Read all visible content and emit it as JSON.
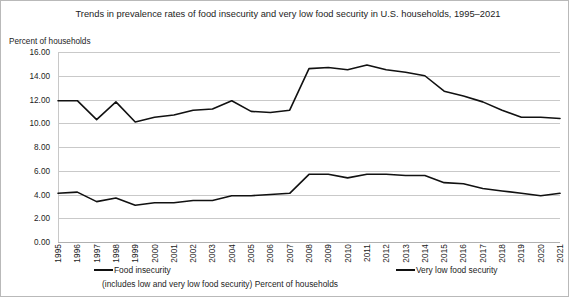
{
  "chart_data": {
    "type": "line",
    "title": "Trends in prevalence rates of food insecurity and very low food security in U.S. households, 1995–2021",
    "ylabel": "Percent of households",
    "xlabel": "",
    "ylim": [
      0.0,
      16.0
    ],
    "ytick_step": 2.0,
    "ytick_labels": [
      "0.00",
      "2.00",
      "4.00",
      "6.00",
      "8.00",
      "10.00",
      "12.00",
      "14.00",
      "16.00"
    ],
    "grid": true,
    "legend_position": "bottom",
    "subcaption": "(includes low and very low food security) Percent of households",
    "categories": [
      "1995",
      "1996",
      "1997",
      "1998",
      "1999",
      "2000",
      "2001",
      "2002",
      "2003",
      "2004",
      "2005",
      "2006",
      "2007",
      "2008",
      "2009",
      "2010",
      "2011",
      "2012",
      "2013",
      "2014",
      "2015",
      "2016",
      "2017",
      "2018",
      "2019",
      "2020",
      "2021"
    ],
    "series": [
      {
        "name": "Food insecurity",
        "values": [
          11.9,
          11.9,
          10.3,
          11.8,
          10.1,
          10.5,
          10.7,
          11.1,
          11.2,
          11.9,
          11.0,
          10.9,
          11.1,
          14.6,
          14.7,
          14.5,
          14.9,
          14.5,
          14.3,
          14.0,
          12.7,
          12.3,
          11.8,
          11.1,
          10.5,
          10.5,
          10.4
        ]
      },
      {
        "name": "Very low food security",
        "values": [
          4.1,
          4.2,
          3.4,
          3.7,
          3.1,
          3.3,
          3.3,
          3.5,
          3.5,
          3.9,
          3.9,
          4.0,
          4.1,
          5.7,
          5.7,
          5.4,
          5.7,
          5.7,
          5.6,
          5.6,
          5.0,
          4.9,
          4.5,
          4.3,
          4.1,
          3.9,
          4.1
        ]
      }
    ]
  }
}
